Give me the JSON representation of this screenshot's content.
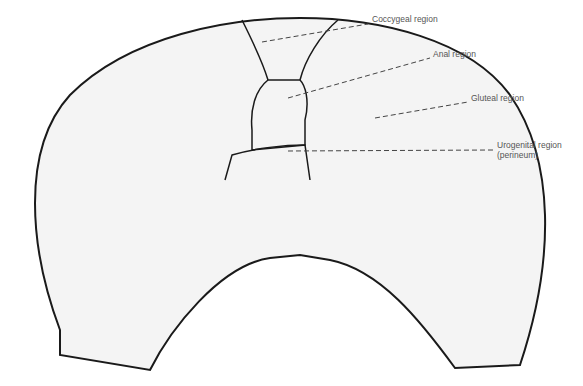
{
  "diagram": {
    "type": "anatomical-regions-schematic",
    "colors": {
      "outline": "#1a1a1a",
      "leader": "#444444",
      "label": "#555555",
      "fill": "#f4f4f4"
    },
    "labels": [
      {
        "id": "coccygeal",
        "text": "Coccygeal region",
        "x": 372,
        "y": 19
      },
      {
        "id": "anal",
        "text": "Anal region",
        "x": 433,
        "y": 54
      },
      {
        "id": "gluteal",
        "text": "Gluteal region",
        "x": 471,
        "y": 98
      },
      {
        "id": "urogenital",
        "text": "Urogenital region",
        "x": 497,
        "y": 145
      },
      {
        "id": "urogenital_sub",
        "text": "(perineum)",
        "x": 497,
        "y": 155
      }
    ]
  }
}
